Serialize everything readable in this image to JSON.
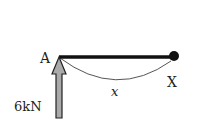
{
  "diagram": {
    "type": "beam-free-body",
    "labels": {
      "left_end": "A",
      "right_end": "X",
      "distance": "x",
      "force": "6kN"
    },
    "colors": {
      "beam": "#111111",
      "arrow_fill": "#aaaaaa",
      "arrow_stroke": "#222222",
      "arc": "#444444"
    }
  }
}
